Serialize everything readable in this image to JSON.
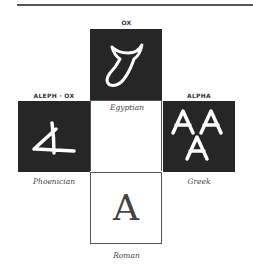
{
  "diagram": {
    "title_captions": {
      "top": "OX",
      "left": "ALEPH · OX",
      "right": "ALPHA"
    },
    "labels": {
      "top": "Egyptian",
      "left": "Phoenician",
      "right": "Greek",
      "bottom": "Roman"
    },
    "glyphs": {
      "egyptian": "ox-head-icon",
      "phoenician": "aleph-icon",
      "greek": "AA A",
      "roman": "A"
    },
    "colors": {
      "dark_box": "#262626",
      "glyph": "#ffffff",
      "line": "#555555"
    }
  }
}
